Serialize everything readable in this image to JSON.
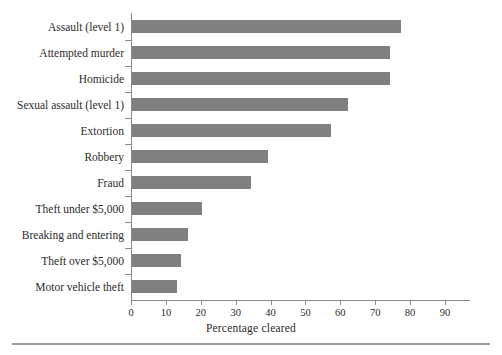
{
  "chart_data": {
    "type": "bar",
    "orientation": "horizontal",
    "title": "",
    "xlabel": "Percentage cleared",
    "ylabel": "",
    "xlim": [
      0,
      97
    ],
    "xticks": [
      0,
      10,
      20,
      30,
      40,
      50,
      60,
      70,
      80,
      90
    ],
    "xtick_labels": [
      "0",
      "10",
      "20",
      "30",
      "40",
      "50",
      "60",
      "70",
      "80",
      "90"
    ],
    "grid": false,
    "legend": null,
    "bar_color": "#808080",
    "axis_color": "#8a8a8a",
    "categories": [
      "Assault (level 1)",
      "Attempted murder",
      "Homicide",
      "Sexual assault (level 1)",
      "Extortion",
      "Robbery",
      "Fraud",
      "Theft under $5,000",
      "Breaking and entering",
      "Theft over $5,000",
      "Motor vehicle theft"
    ],
    "values": [
      77,
      74,
      74,
      62,
      57,
      39,
      34,
      20,
      16,
      14,
      13
    ],
    "series": [
      {
        "name": "Percentage cleared",
        "values": [
          77,
          74,
          74,
          62,
          57,
          39,
          34,
          20,
          16,
          14,
          13
        ]
      }
    ]
  }
}
